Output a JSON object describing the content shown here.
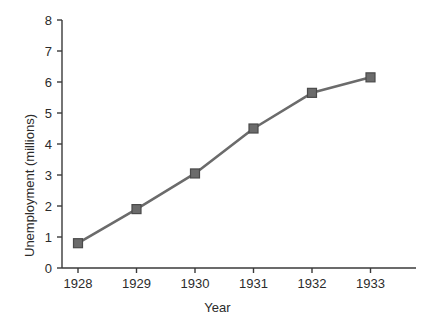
{
  "chart_data": {
    "type": "line",
    "title": "",
    "xlabel": "Year",
    "ylabel": "Unemployment (millions)",
    "categories": [
      "1928",
      "1929",
      "1930",
      "1931",
      "1932",
      "1933"
    ],
    "x": [
      1928,
      1929,
      1930,
      1931,
      1932,
      1933
    ],
    "values": [
      0.8,
      1.9,
      3.05,
      4.5,
      5.65,
      6.15
    ],
    "series": [
      {
        "name": "Unemployment",
        "values": [
          0.8,
          1.9,
          3.05,
          4.5,
          5.65,
          6.15
        ]
      }
    ],
    "ylim": [
      0,
      8
    ],
    "y_ticks": [
      "0",
      "1",
      "2",
      "3",
      "4",
      "5",
      "6",
      "7",
      "8"
    ],
    "x_ticks": [
      "1928",
      "1929",
      "1930",
      "1931",
      "1932",
      "1933"
    ],
    "grid": false,
    "legend": false,
    "marker": "square",
    "colors": {
      "line": "#6b6b6b",
      "marker": "#6b6b6b",
      "marker_edge": "#4a4a4a",
      "axis": "#3a3a3a",
      "text": "#2b2b2b",
      "background": "#ffffff"
    }
  }
}
